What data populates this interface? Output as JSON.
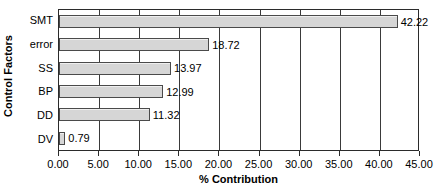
{
  "chart_data": {
    "type": "bar",
    "orientation": "horizontal",
    "title": "",
    "xlabel": "% Contribution",
    "ylabel": "Control Factors",
    "categories": [
      "SMT",
      "error",
      "SS",
      "BP",
      "DD",
      "DV"
    ],
    "values": [
      42.22,
      18.72,
      13.97,
      12.99,
      11.32,
      0.79
    ],
    "value_labels": [
      "42.22",
      "18.72",
      "13.97",
      "12.99",
      "11.32",
      "0.79"
    ],
    "xlim": [
      0,
      45
    ],
    "xticks": [
      0,
      5,
      10,
      15,
      20,
      25,
      30,
      35,
      40,
      45
    ],
    "xtick_labels": [
      "0.00",
      "5.00",
      "10.00",
      "15.00",
      "20.00",
      "25.00",
      "30.00",
      "35.00",
      "40.00",
      "45.00"
    ],
    "grid": "vertical",
    "legend": null,
    "bar_fill_color": "#d6d6d6",
    "bar_border_color": "#4a4a4a",
    "axis_color": "#2b2b2b",
    "background_color": "#ffffff"
  }
}
